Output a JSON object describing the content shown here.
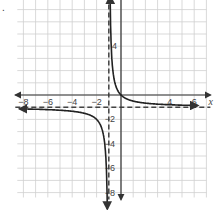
{
  "problem": {
    "number": "."
  },
  "chart_data": {
    "type": "line",
    "title": "",
    "function": "y = 1/(x+1) - 1",
    "xlabel": "x",
    "ylabel": "y",
    "xlim": [
      -8,
      7
    ],
    "ylim": [
      -8,
      8
    ],
    "grid": true,
    "x_tick_labels": [
      "-8",
      "-6",
      "-4",
      "-2",
      "4",
      "6"
    ],
    "y_tick_labels": [
      "8",
      "4",
      "-2",
      "-4",
      "-6",
      "-8"
    ],
    "asymptotes": {
      "vertical": -1,
      "horizontal": -1,
      "style": "dashed"
    },
    "series": [
      {
        "name": "right branch",
        "x": [
          -0.88,
          -0.8,
          -0.6,
          -0.4,
          0,
          1,
          2,
          4,
          6
        ],
        "y": [
          7.33,
          4,
          1.5,
          0.67,
          0,
          -0.5,
          -0.67,
          -0.8,
          -0.86
        ]
      },
      {
        "name": "left branch",
        "x": [
          -8,
          -6,
          -4,
          -3,
          -2,
          -1.5,
          -1.2,
          -1.12
        ],
        "y": [
          -1.14,
          -1.2,
          -1.33,
          -1.5,
          -2,
          -3,
          -6,
          -9.33
        ]
      }
    ]
  },
  "colors": {
    "grid": "#cfcfcf",
    "axis": "#333333",
    "curve": "#222222",
    "asymptote": "#444444"
  }
}
